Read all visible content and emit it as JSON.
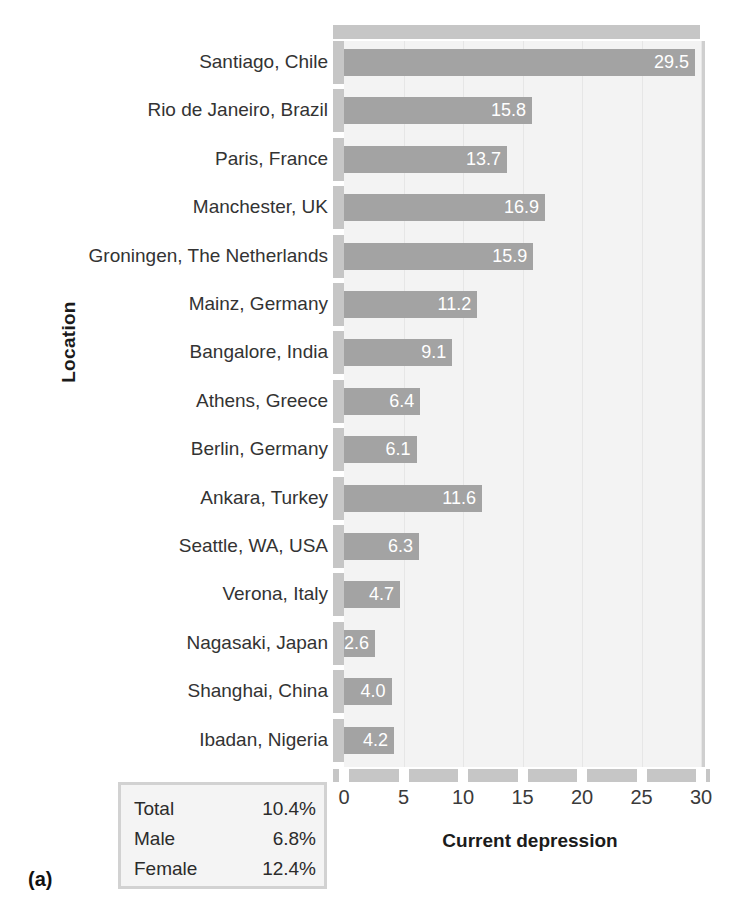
{
  "chart_data": {
    "type": "bar",
    "orientation": "horizontal",
    "title": "",
    "xlabel": "Current depression",
    "ylabel": "Location",
    "xlim": [
      0,
      30
    ],
    "xticks": [
      "0",
      "5",
      "10",
      "15",
      "20",
      "25",
      "30"
    ],
    "grid": true,
    "legend_position": "none",
    "bar_color": "#a3a3a3",
    "panel_color": "#f3f3f3",
    "axis_color": "#c6c6c6",
    "categories": [
      "Santiago, Chile",
      "Rio de Janeiro, Brazil",
      "Paris, France",
      "Manchester, UK",
      "Groningen, The Netherlands",
      "Mainz, Germany",
      "Bangalore, India",
      "Athens, Greece",
      "Berlin, Germany",
      "Ankara, Turkey",
      "Seattle, WA, USA",
      "Verona, Italy",
      "Nagasaki, Japan",
      "Shanghai, China",
      "Ibadan, Nigeria"
    ],
    "values": [
      29.5,
      15.8,
      13.7,
      16.9,
      15.9,
      11.2,
      9.1,
      6.4,
      6.1,
      11.6,
      6.3,
      4.7,
      2.6,
      4.0,
      4.2
    ],
    "value_labels": [
      "29.5",
      "15.8",
      "13.7",
      "16.9",
      "15.9",
      "11.2",
      "9.1",
      "6.4",
      "6.1",
      "11.6",
      "6.3",
      "4.7",
      "2.6",
      "4.0",
      "4.2"
    ]
  },
  "summary": {
    "rows": [
      {
        "label": "Total",
        "value": "10.4%"
      },
      {
        "label": "Male",
        "value": "6.8%"
      },
      {
        "label": "Female",
        "value": "12.4%"
      }
    ]
  },
  "caption": "(a)"
}
